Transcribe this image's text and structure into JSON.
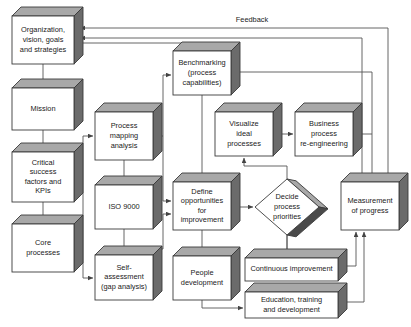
{
  "diagram": {
    "style": {
      "box_face_color": "#ffffff",
      "box_top_color": "#a8a8a8",
      "box_side_color": "#6b6b6b",
      "line_color": "#555555",
      "text_color": "#1a1a1a",
      "background": "#ffffff"
    },
    "edge_labels": [
      {
        "id": "feedback",
        "text": "Feedback",
        "x": 252,
        "y": 22
      }
    ],
    "nodes": [
      {
        "id": "organization",
        "shape": "box3d",
        "x": 12,
        "y": 16,
        "w": 62,
        "h": 48,
        "d": 9,
        "lines": [
          "Organization,",
          "vision, goals",
          "and strategies"
        ]
      },
      {
        "id": "mission",
        "shape": "box3d",
        "x": 12,
        "y": 88,
        "w": 62,
        "h": 42,
        "d": 9,
        "lines": [
          "Mission"
        ]
      },
      {
        "id": "critical-success-factors",
        "shape": "box3d",
        "x": 12,
        "y": 152,
        "w": 62,
        "h": 50,
        "d": 9,
        "lines": [
          "Critical",
          "success",
          "factors and",
          "KPIs"
        ]
      },
      {
        "id": "core-processes",
        "shape": "box3d",
        "x": 12,
        "y": 224,
        "w": 62,
        "h": 48,
        "d": 9,
        "lines": [
          "Core",
          "processes"
        ]
      },
      {
        "id": "process-mapping-analysis",
        "shape": "box3d",
        "x": 95,
        "y": 112,
        "w": 58,
        "h": 48,
        "d": 9,
        "lines": [
          "Process",
          "mapping",
          "analysis"
        ]
      },
      {
        "id": "iso-9000",
        "shape": "box3d",
        "x": 95,
        "y": 185,
        "w": 58,
        "h": 44,
        "d": 9,
        "lines": [
          "ISO 9000"
        ]
      },
      {
        "id": "self-assessment",
        "shape": "box3d",
        "x": 95,
        "y": 255,
        "w": 58,
        "h": 45,
        "d": 9,
        "lines": [
          "Self-",
          "assessment",
          "(gap analysis)"
        ]
      },
      {
        "id": "benchmarking",
        "shape": "box3d",
        "x": 173,
        "y": 51,
        "w": 58,
        "h": 44,
        "d": 9,
        "lines": [
          "Benchmarking",
          "(process",
          "capabilities)"
        ]
      },
      {
        "id": "define-opportunities",
        "shape": "box3d",
        "x": 173,
        "y": 182,
        "w": 58,
        "h": 48,
        "d": 9,
        "lines": [
          "Define",
          "opportunities",
          "for",
          "improvement"
        ]
      },
      {
        "id": "people-development",
        "shape": "box3d",
        "x": 173,
        "y": 256,
        "w": 58,
        "h": 44,
        "d": 9,
        "lines": [
          "People",
          "development"
        ]
      },
      {
        "id": "visualize-ideal-processes",
        "shape": "box3d",
        "x": 215,
        "y": 112,
        "w": 58,
        "h": 44,
        "d": 9,
        "lines": [
          "Visualize",
          "ideal",
          "processes"
        ]
      },
      {
        "id": "business-process-re-engineering",
        "shape": "box3d",
        "x": 295,
        "y": 112,
        "w": 58,
        "h": 44,
        "d": 9,
        "lines": [
          "Business",
          "process",
          "re-engineering"
        ]
      },
      {
        "id": "measurement-of-progress",
        "shape": "box3d",
        "x": 341,
        "y": 182,
        "w": 58,
        "h": 48,
        "d": 9,
        "lines": [
          "Measurement",
          "of progress"
        ]
      },
      {
        "id": "continuous-improvement",
        "shape": "box3d",
        "x": 245,
        "y": 258,
        "w": 93,
        "h": 23,
        "d": 9,
        "lines": [
          "Continuous improvement"
        ]
      },
      {
        "id": "education-training",
        "shape": "box3d",
        "x": 245,
        "y": 292,
        "w": 93,
        "h": 26,
        "d": 9,
        "lines": [
          "Education, training",
          "and development"
        ]
      },
      {
        "id": "decide-process-priorities",
        "shape": "diamond3d",
        "cx": 287,
        "cy": 207,
        "rx": 32,
        "ry": 28,
        "lines": [
          "Decide",
          "process",
          "priorities"
        ]
      }
    ]
  }
}
